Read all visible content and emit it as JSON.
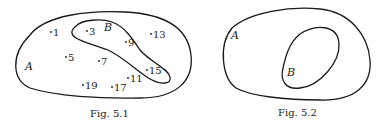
{
  "figures": [
    {
      "caption": "Fig. 5.1",
      "outer_set_label": "A",
      "inner_set_label": "B",
      "elements": [
        {
          "label": "1",
          "x": 52,
          "y": 35,
          "in_B": false
        },
        {
          "label": "3",
          "x": 88,
          "y": 34,
          "in_B": true
        },
        {
          "label": "9",
          "x": 127,
          "y": 45,
          "in_B": true
        },
        {
          "label": "13",
          "x": 151,
          "y": 37,
          "in_B": false
        },
        {
          "label": "5",
          "x": 66,
          "y": 60,
          "in_B": false
        },
        {
          "label": "7",
          "x": 99,
          "y": 64,
          "in_B": false
        },
        {
          "label": "15",
          "x": 147,
          "y": 73,
          "in_B": true
        },
        {
          "label": "11",
          "x": 128,
          "y": 81,
          "in_B": false
        },
        {
          "label": "19",
          "x": 83,
          "y": 88,
          "in_B": false
        },
        {
          "label": "17",
          "x": 112,
          "y": 90,
          "in_B": false
        }
      ]
    },
    {
      "caption": "Fig. 5.2",
      "outer_set_label": "A",
      "inner_set_label": "B"
    }
  ]
}
